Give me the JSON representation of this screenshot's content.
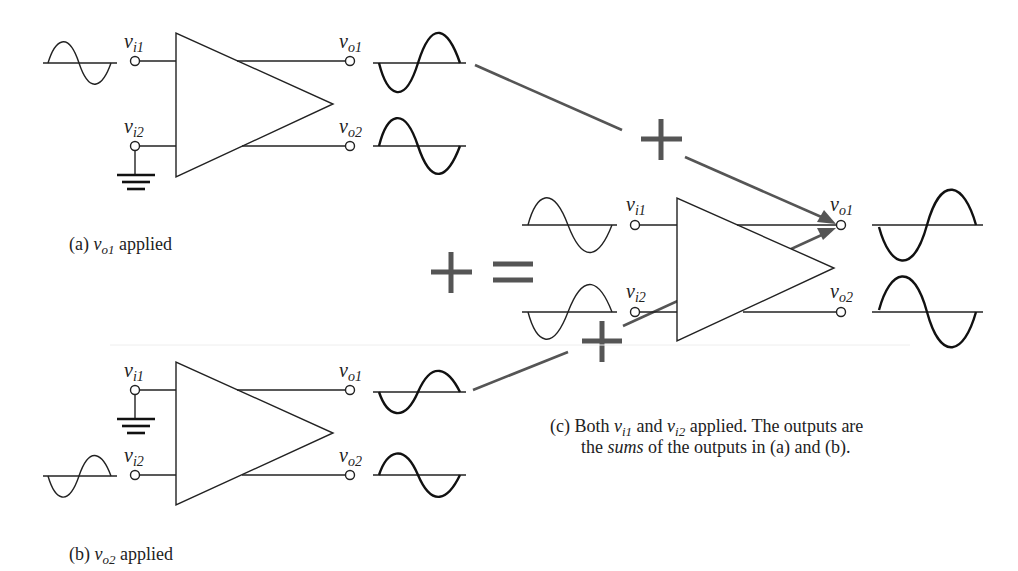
{
  "figure": {
    "panel_a": {
      "caption_prefix": "(a) ",
      "caption_var": "v",
      "caption_sub": "o1",
      "caption_suffix": " applied",
      "labels": {
        "vi1": {
          "base": "v",
          "sub": "i1"
        },
        "vi2": {
          "base": "v",
          "sub": "i2"
        },
        "vo1": {
          "base": "v",
          "sub": "o1"
        },
        "vo2": {
          "base": "v",
          "sub": "o2"
        }
      },
      "input_signal": "vi1",
      "grounded_input": "vi2"
    },
    "panel_b": {
      "caption_prefix": "(b) ",
      "caption_var": "v",
      "caption_sub": "o2",
      "caption_suffix": " applied",
      "labels": {
        "vi1": {
          "base": "v",
          "sub": "i1"
        },
        "vi2": {
          "base": "v",
          "sub": "i2"
        },
        "vo1": {
          "base": "v",
          "sub": "o1"
        },
        "vo2": {
          "base": "v",
          "sub": "o2"
        }
      },
      "input_signal": "vi2",
      "grounded_input": "vi1"
    },
    "panel_c": {
      "caption_line1_prefix": "(c) Both ",
      "caption_var1": "v",
      "caption_sub1": "i1",
      "caption_mid": "  and ",
      "caption_var2": "v",
      "caption_sub2": "i2",
      "caption_line1_suffix": "  applied. The outputs are",
      "caption_line2_prefix": "the ",
      "caption_line2_italic": "sums",
      "caption_line2_suffix": "  of the outputs in (a) and (b).",
      "labels": {
        "vi1": {
          "base": "v",
          "sub": "i1"
        },
        "vi2": {
          "base": "v",
          "sub": "i2"
        },
        "vo1": {
          "base": "v",
          "sub": "o1"
        },
        "vo2": {
          "base": "v",
          "sub": "o2"
        }
      }
    },
    "operators": {
      "plus_symbol": "+",
      "equals_symbol": "="
    },
    "colors": {
      "line": "#222222",
      "arrow": "#555555",
      "background": "#ffffff"
    }
  }
}
